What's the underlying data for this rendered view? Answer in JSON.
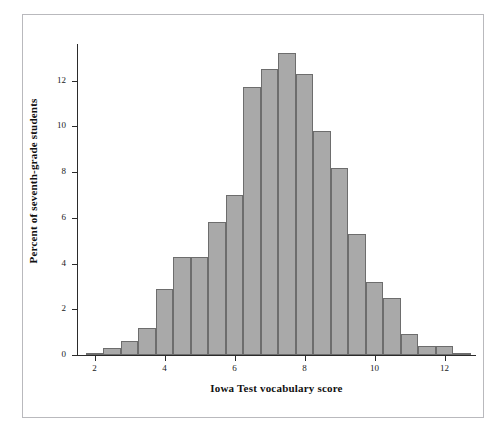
{
  "page": {
    "header_faint_text": "",
    "frame_color": "#b9b9bd"
  },
  "chart_data": {
    "type": "bar",
    "subtype": "histogram",
    "title": "",
    "xlabel": "Iowa Test vocabulary score",
    "ylabel": "Percent of seventh-grade students",
    "bar_fill_color": "#a9a9a9",
    "bar_edge_color": "#6d6d6d",
    "axis_color": "#2b2b2b",
    "grid": false,
    "legend": null,
    "xlim": [
      1.5,
      12.9
    ],
    "ylim": [
      0,
      13.6
    ],
    "bin_width": 0.5,
    "xticks": [
      2,
      4,
      6,
      8,
      10,
      12
    ],
    "xtick_labels": [
      "2",
      "4",
      "6",
      "8",
      "10",
      "12"
    ],
    "yticks": [
      0,
      2,
      4,
      6,
      8,
      10,
      12
    ],
    "ytick_labels": [
      "0",
      "2",
      "4",
      "6",
      "8",
      "10",
      "12"
    ],
    "bin_starts": [
      1.75,
      2.25,
      2.75,
      3.25,
      3.75,
      4.25,
      4.75,
      5.25,
      5.75,
      6.25,
      6.75,
      7.25,
      7.75,
      8.25,
      8.75,
      9.25,
      9.75,
      10.25,
      10.75,
      11.25,
      11.75,
      12.25
    ],
    "categories": [
      "1.75-2.25",
      "2.25-2.75",
      "2.75-3.25",
      "3.25-3.75",
      "3.75-4.25",
      "4.25-4.75",
      "4.75-5.25",
      "5.25-5.75",
      "5.75-6.25",
      "6.25-6.75",
      "6.75-7.25",
      "7.25-7.75",
      "7.75-8.25",
      "8.25-8.75",
      "8.75-9.25",
      "9.25-9.75",
      "9.75-10.25",
      "10.25-10.75",
      "10.75-11.25",
      "11.25-11.75",
      "11.75-12.25",
      "12.25-12.75"
    ],
    "values": [
      0.1,
      0.3,
      0.6,
      1.2,
      2.9,
      4.3,
      4.3,
      5.8,
      7.0,
      11.7,
      12.5,
      13.2,
      12.3,
      9.8,
      8.2,
      5.3,
      3.2,
      2.5,
      0.9,
      0.4,
      0.4,
      0.1
    ]
  }
}
